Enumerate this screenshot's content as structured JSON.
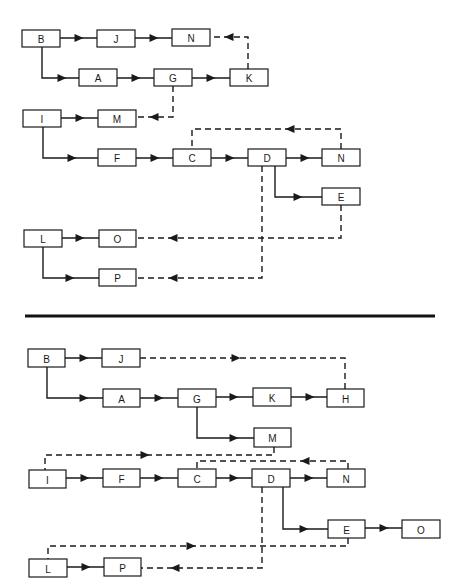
{
  "colors": {
    "line": "#1a1a1a",
    "box_fill": "#ffffff",
    "background": "#ffffff"
  },
  "separator": {
    "x1": 25,
    "x2": 435,
    "y": 316
  },
  "diagrams": [
    {
      "name": "top-diagram",
      "nodes": [
        {
          "id": "t-B",
          "label": "B",
          "x": 22,
          "y": 30,
          "w": 38,
          "h": 17
        },
        {
          "id": "t-J",
          "label": "J",
          "x": 97,
          "y": 30,
          "w": 38,
          "h": 17
        },
        {
          "id": "t-N1",
          "label": "N",
          "x": 172,
          "y": 29,
          "w": 38,
          "h": 17
        },
        {
          "id": "t-A",
          "label": "A",
          "x": 79,
          "y": 69,
          "w": 38,
          "h": 17
        },
        {
          "id": "t-G",
          "label": "G",
          "x": 154,
          "y": 69,
          "w": 38,
          "h": 17
        },
        {
          "id": "t-K",
          "label": "K",
          "x": 230,
          "y": 69,
          "w": 38,
          "h": 17
        },
        {
          "id": "t-I",
          "label": "I",
          "x": 23,
          "y": 110,
          "w": 38,
          "h": 17
        },
        {
          "id": "t-M",
          "label": "M",
          "x": 98,
          "y": 110,
          "w": 38,
          "h": 17
        },
        {
          "id": "t-F",
          "label": "F",
          "x": 98,
          "y": 149,
          "w": 38,
          "h": 17
        },
        {
          "id": "t-C",
          "label": "C",
          "x": 173,
          "y": 149,
          "w": 38,
          "h": 17
        },
        {
          "id": "t-D",
          "label": "D",
          "x": 248,
          "y": 149,
          "w": 38,
          "h": 17
        },
        {
          "id": "t-N2",
          "label": "N",
          "x": 322,
          "y": 149,
          "w": 38,
          "h": 17
        },
        {
          "id": "t-E",
          "label": "E",
          "x": 322,
          "y": 188,
          "w": 38,
          "h": 17
        },
        {
          "id": "t-L",
          "label": "L",
          "x": 24,
          "y": 230,
          "w": 38,
          "h": 17
        },
        {
          "id": "t-O",
          "label": "O",
          "x": 99,
          "y": 230,
          "w": 37,
          "h": 17
        },
        {
          "id": "t-P",
          "label": "P",
          "x": 99,
          "y": 269,
          "w": 37,
          "h": 17
        }
      ],
      "edges": [
        {
          "from": "B",
          "to": "J",
          "style": "solid",
          "points": [
            [
              60,
              38
            ],
            [
              97,
              38
            ]
          ],
          "arrow_at": [
            79,
            38
          ],
          "dir": "right"
        },
        {
          "from": "J",
          "to": "N",
          "style": "solid",
          "points": [
            [
              135,
              38
            ],
            [
              172,
              38
            ]
          ],
          "arrow_at": [
            154,
            38
          ],
          "dir": "right"
        },
        {
          "from": "B",
          "to": "A",
          "style": "solid",
          "points": [
            [
              42,
              47
            ],
            [
              42,
              78
            ],
            [
              79,
              78
            ]
          ],
          "arrow_at": [
            62,
            78
          ],
          "dir": "right"
        },
        {
          "from": "A",
          "to": "G",
          "style": "solid",
          "points": [
            [
              117,
              78
            ],
            [
              154,
              78
            ]
          ],
          "arrow_at": [
            136,
            78
          ],
          "dir": "right"
        },
        {
          "from": "G",
          "to": "K",
          "style": "solid",
          "points": [
            [
              192,
              78
            ],
            [
              230,
              78
            ]
          ],
          "arrow_at": [
            211,
            78
          ],
          "dir": "right"
        },
        {
          "from": "K",
          "to": "N",
          "style": "dashed",
          "points": [
            [
              248,
              69
            ],
            [
              248,
              37
            ],
            [
              210,
              37
            ]
          ],
          "arrow_at": [
            229,
            37
          ],
          "dir": "left"
        },
        {
          "from": "G",
          "to": "M",
          "style": "dashed",
          "points": [
            [
              173,
              86
            ],
            [
              173,
              117
            ],
            [
              136,
              117
            ]
          ],
          "arrow_at": [
            154,
            117
          ],
          "dir": "left"
        },
        {
          "from": "I",
          "to": "M",
          "style": "solid",
          "points": [
            [
              61,
              118
            ],
            [
              98,
              118
            ]
          ],
          "arrow_at": [
            80,
            118
          ],
          "dir": "right"
        },
        {
          "from": "I",
          "to": "F",
          "style": "solid",
          "points": [
            [
              43,
              127
            ],
            [
              43,
              158
            ],
            [
              98,
              158
            ]
          ],
          "arrow_at": [
            72,
            158
          ],
          "dir": "right"
        },
        {
          "from": "F",
          "to": "C",
          "style": "solid",
          "points": [
            [
              136,
              158
            ],
            [
              173,
              158
            ]
          ],
          "arrow_at": [
            155,
            158
          ],
          "dir": "right"
        },
        {
          "from": "C",
          "to": "D",
          "style": "solid",
          "points": [
            [
              211,
              158
            ],
            [
              248,
              158
            ]
          ],
          "arrow_at": [
            230,
            158
          ],
          "dir": "right"
        },
        {
          "from": "D",
          "to": "N",
          "style": "solid",
          "points": [
            [
              286,
              158
            ],
            [
              322,
              158
            ]
          ],
          "arrow_at": [
            305,
            158
          ],
          "dir": "right"
        },
        {
          "from": "N",
          "to": "C",
          "style": "dashed",
          "points": [
            [
              341,
              149
            ],
            [
              341,
              129
            ],
            [
              192,
              129
            ],
            [
              192,
              149
            ]
          ],
          "arrow_at": [
            290,
            129
          ],
          "dir": "left"
        },
        {
          "from": "D",
          "to": "E",
          "style": "solid",
          "points": [
            [
              275,
              166
            ],
            [
              275,
              197
            ],
            [
              322,
              197
            ]
          ],
          "arrow_at": [
            298,
            197
          ],
          "dir": "right"
        },
        {
          "from": "E",
          "to": "O",
          "style": "dashed",
          "points": [
            [
              341,
              205
            ],
            [
              341,
              238
            ],
            [
              136,
              238
            ]
          ],
          "arrow_at": [
            173,
            238
          ],
          "dir": "left"
        },
        {
          "from": "D",
          "to": "P",
          "style": "dashed",
          "points": [
            [
              262,
              166
            ],
            [
              262,
              278
            ],
            [
              136,
              278
            ]
          ],
          "arrow_at": [
            173,
            278
          ],
          "dir": "left"
        },
        {
          "from": "L",
          "to": "O",
          "style": "solid",
          "points": [
            [
              62,
              238
            ],
            [
              99,
              238
            ]
          ],
          "arrow_at": [
            80,
            238
          ],
          "dir": "right"
        },
        {
          "from": "L",
          "to": "P",
          "style": "solid",
          "points": [
            [
              43,
              247
            ],
            [
              43,
              278
            ],
            [
              99,
              278
            ]
          ],
          "arrow_at": [
            70,
            278
          ],
          "dir": "right"
        }
      ]
    },
    {
      "name": "bottom-diagram",
      "nodes": [
        {
          "id": "b-B",
          "label": "B",
          "x": 28,
          "y": 349,
          "w": 37,
          "h": 18
        },
        {
          "id": "b-J",
          "label": "J",
          "x": 102,
          "y": 349,
          "w": 38,
          "h": 18
        },
        {
          "id": "b-A",
          "label": "A",
          "x": 103,
          "y": 389,
          "w": 37,
          "h": 18
        },
        {
          "id": "b-G",
          "label": "G",
          "x": 178,
          "y": 389,
          "w": 38,
          "h": 18
        },
        {
          "id": "b-K",
          "label": "K",
          "x": 253,
          "y": 388,
          "w": 38,
          "h": 18
        },
        {
          "id": "b-H",
          "label": "H",
          "x": 327,
          "y": 389,
          "w": 37,
          "h": 18
        },
        {
          "id": "b-M",
          "label": "M",
          "x": 254,
          "y": 428,
          "w": 37,
          "h": 19
        },
        {
          "id": "b-I",
          "label": "I",
          "x": 29,
          "y": 470,
          "w": 37,
          "h": 18
        },
        {
          "id": "b-F",
          "label": "F",
          "x": 103,
          "y": 469,
          "w": 37,
          "h": 18
        },
        {
          "id": "b-C",
          "label": "C",
          "x": 178,
          "y": 469,
          "w": 38,
          "h": 18
        },
        {
          "id": "b-D",
          "label": "D",
          "x": 252,
          "y": 469,
          "w": 38,
          "h": 18
        },
        {
          "id": "b-N",
          "label": "N",
          "x": 327,
          "y": 469,
          "w": 38,
          "h": 18
        },
        {
          "id": "b-E",
          "label": "E",
          "x": 328,
          "y": 520,
          "w": 37,
          "h": 18
        },
        {
          "id": "b-O",
          "label": "O",
          "x": 402,
          "y": 520,
          "w": 38,
          "h": 18
        },
        {
          "id": "b-L",
          "label": "L",
          "x": 29,
          "y": 559,
          "w": 38,
          "h": 18
        },
        {
          "id": "b-P",
          "label": "P",
          "x": 104,
          "y": 558,
          "w": 37,
          "h": 18
        }
      ],
      "edges": [
        {
          "from": "B",
          "to": "J",
          "style": "solid",
          "points": [
            [
              65,
              358
            ],
            [
              102,
              358
            ]
          ],
          "arrow_at": [
            84,
            358
          ],
          "dir": "right"
        },
        {
          "from": "J",
          "to": "H",
          "style": "dashed",
          "points": [
            [
              140,
              358
            ],
            [
              345,
              358
            ],
            [
              345,
              389
            ]
          ],
          "arrow_at": [
            236,
            358
          ],
          "dir": "right"
        },
        {
          "from": "B",
          "to": "A",
          "style": "solid",
          "points": [
            [
              47,
              367
            ],
            [
              47,
              398
            ],
            [
              103,
              398
            ]
          ],
          "arrow_at": [
            84,
            398
          ],
          "dir": "right"
        },
        {
          "from": "A",
          "to": "G",
          "style": "solid",
          "points": [
            [
              140,
              398
            ],
            [
              178,
              398
            ]
          ],
          "arrow_at": [
            159,
            398
          ],
          "dir": "right"
        },
        {
          "from": "G",
          "to": "K",
          "style": "solid",
          "points": [
            [
              216,
              397
            ],
            [
              253,
              397
            ]
          ],
          "arrow_at": [
            234,
            397
          ],
          "dir": "right"
        },
        {
          "from": "K",
          "to": "H",
          "style": "solid",
          "points": [
            [
              291,
              397
            ],
            [
              327,
              397
            ]
          ],
          "arrow_at": [
            310,
            397
          ],
          "dir": "right"
        },
        {
          "from": "G",
          "to": "M",
          "style": "solid",
          "points": [
            [
              197,
              407
            ],
            [
              197,
              438
            ],
            [
              254,
              438
            ]
          ],
          "arrow_at": [
            234,
            438
          ],
          "dir": "right"
        },
        {
          "from": "M",
          "to": "I",
          "style": "dashed",
          "points": [
            [
              274,
              447
            ],
            [
              274,
              455
            ],
            [
              45,
              455
            ],
            [
              45,
              470
            ]
          ],
          "arrow_at": [
            145,
            455
          ],
          "dir": "right"
        },
        {
          "from": "N",
          "to": "C",
          "style": "dashed",
          "points": [
            [
              348,
              469
            ],
            [
              348,
              461
            ],
            [
              197,
              461
            ],
            [
              197,
              469
            ]
          ],
          "arrow_at": [
            305,
            461
          ],
          "dir": "left"
        },
        {
          "from": "I",
          "to": "F",
          "style": "solid",
          "points": [
            [
              66,
              478
            ],
            [
              103,
              478
            ]
          ],
          "arrow_at": [
            85,
            478
          ],
          "dir": "right"
        },
        {
          "from": "F",
          "to": "C",
          "style": "solid",
          "points": [
            [
              140,
              478
            ],
            [
              178,
              478
            ]
          ],
          "arrow_at": [
            159,
            478
          ],
          "dir": "right"
        },
        {
          "from": "C",
          "to": "D",
          "style": "solid",
          "points": [
            [
              216,
              478
            ],
            [
              252,
              478
            ]
          ],
          "arrow_at": [
            234,
            478
          ],
          "dir": "right"
        },
        {
          "from": "D",
          "to": "N",
          "style": "solid",
          "points": [
            [
              290,
              478
            ],
            [
              327,
              478
            ]
          ],
          "arrow_at": [
            309,
            478
          ],
          "dir": "right"
        },
        {
          "from": "D",
          "to": "E",
          "style": "solid",
          "points": [
            [
              283,
              487
            ],
            [
              283,
              529
            ],
            [
              328,
              529
            ]
          ],
          "arrow_at": [
            304,
            529
          ],
          "dir": "right"
        },
        {
          "from": "E",
          "to": "O",
          "style": "solid",
          "points": [
            [
              365,
              528
            ],
            [
              402,
              528
            ]
          ],
          "arrow_at": [
            384,
            528
          ],
          "dir": "right"
        },
        {
          "from": "E",
          "to": "L",
          "style": "dashed",
          "points": [
            [
              348,
              538
            ],
            [
              348,
              546
            ],
            [
              48,
              546
            ],
            [
              48,
              559
            ]
          ],
          "arrow_at": [
            191,
            546
          ],
          "dir": "right"
        },
        {
          "from": "D",
          "to": "P",
          "style": "dashed",
          "points": [
            [
              262,
              487
            ],
            [
              262,
              568
            ],
            [
              141,
              568
            ]
          ],
          "arrow_at": [
            175,
            568
          ],
          "dir": "left"
        },
        {
          "from": "L",
          "to": "P",
          "style": "solid",
          "points": [
            [
              67,
              567
            ],
            [
              104,
              567
            ]
          ],
          "arrow_at": [
            86,
            567
          ],
          "dir": "right"
        }
      ]
    }
  ]
}
